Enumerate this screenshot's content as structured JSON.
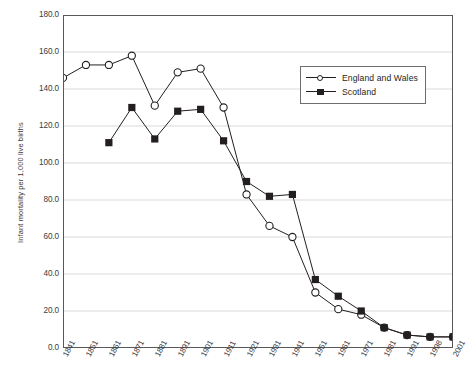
{
  "figure": {
    "title_clipped": "Infant mortality rates, England and Wales and Scotland, 1841-2001"
  },
  "legend": {
    "entries": [
      {
        "label": "England and Wales",
        "marker": "open-circle-marker"
      },
      {
        "label": "Scotland",
        "marker": "filled-square-marker"
      }
    ]
  },
  "chart_data": {
    "type": "line",
    "title": "",
    "xlabel": "",
    "ylabel": "Infant mortality per 1,000 live births",
    "xlim": [
      0,
      17
    ],
    "ylim": [
      0.0,
      180.0
    ],
    "ytick_labels": [
      "180.0",
      "160.0",
      "140.0",
      "120.0",
      "100.0",
      "80.0",
      "60.0",
      "40.0",
      "20.0",
      "0.0"
    ],
    "ytick_values": [
      180,
      160,
      140,
      120,
      100,
      80,
      60,
      40,
      20,
      0
    ],
    "grid": "horizontal",
    "legend_position": "upper-right-inside",
    "categories": [
      "1841",
      "1851",
      "1861",
      "1871",
      "1881",
      "1891",
      "1901",
      "1911",
      "1921",
      "1931",
      "1941",
      "1951",
      "1961",
      "1971",
      "1981",
      "1991",
      "1998",
      "2001"
    ],
    "series": [
      {
        "name": "England and Wales",
        "marker": "open-circle",
        "color": "#231f20",
        "values": [
          146,
          153,
          153,
          158,
          131,
          149,
          151,
          130,
          83,
          66,
          60,
          30,
          21,
          18,
          11,
          7,
          6,
          6
        ]
      },
      {
        "name": "Scotland",
        "marker": "filled-square",
        "color": "#231f20",
        "values": [
          null,
          null,
          111,
          130,
          113,
          128,
          129,
          112,
          90,
          82,
          83,
          37,
          28,
          20,
          11,
          7,
          6,
          6
        ]
      }
    ]
  }
}
